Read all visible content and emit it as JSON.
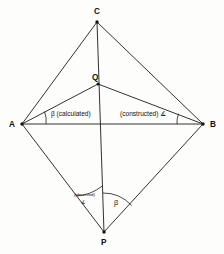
{
  "figure": {
    "background_color": "#fdfdfb",
    "line_color": "#1b1b1b",
    "vertices": [
      {
        "id": "A",
        "label": "A",
        "x": 22,
        "y": 124,
        "label_x": 12,
        "label_y": 127
      },
      {
        "id": "B",
        "label": "B",
        "x": 203,
        "y": 124,
        "label_x": 210,
        "label_y": 127
      },
      {
        "id": "C",
        "label": "C",
        "x": 97,
        "y": 22,
        "label_x": 94,
        "label_y": 14
      },
      {
        "id": "P",
        "label": "P",
        "x": 104,
        "y": 232,
        "label_x": 101,
        "label_y": 244
      },
      {
        "id": "Q",
        "label": "Q",
        "x": 98,
        "y": 84,
        "label_x": 93,
        "label_y": 80
      }
    ],
    "edges": [
      {
        "from": "A",
        "to": "C"
      },
      {
        "from": "C",
        "to": "B"
      },
      {
        "from": "A",
        "to": "B"
      },
      {
        "from": "A",
        "to": "P"
      },
      {
        "from": "P",
        "to": "B"
      },
      {
        "from": "A",
        "to": "Q"
      },
      {
        "from": "Q",
        "to": "B"
      },
      {
        "from": "C",
        "to": "P"
      }
    ],
    "angle_marks": [
      {
        "id": "angle-at-a",
        "vertex": "A",
        "label": "β"
      },
      {
        "id": "angle-at-b",
        "vertex": "B",
        "label": "∡"
      },
      {
        "id": "angle-at-p-left",
        "vertex": "P",
        "label": "∡"
      },
      {
        "id": "angle-at-p-right",
        "vertex": "P",
        "label": "β"
      }
    ],
    "annotations": [
      {
        "id": "calculated-note",
        "text": "β (calculated)",
        "x": 48,
        "y": 114
      },
      {
        "id": "constructed-note",
        "text": "(constructed) ∡",
        "x": 120,
        "y": 114
      },
      {
        "id": "observed-note",
        "text": "(observed)",
        "x": 75,
        "y": 195
      },
      {
        "id": "beta-at-p",
        "text": "β",
        "x": 116,
        "y": 203
      }
    ]
  }
}
